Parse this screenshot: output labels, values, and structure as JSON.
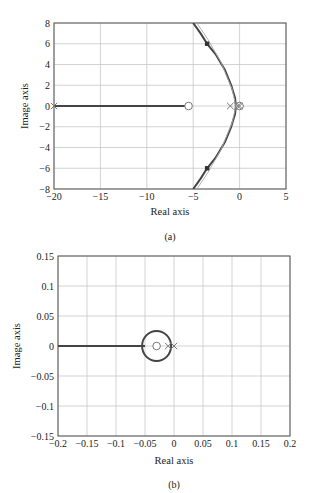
{
  "chart_data": [
    {
      "id": "a",
      "type": "line",
      "title": "",
      "caption": "(a)",
      "xlabel": "Real axis",
      "ylabel": "Image axis",
      "xlim": [
        -20,
        5
      ],
      "ylim": [
        -8,
        8
      ],
      "xticks": [
        -20,
        -15,
        -10,
        -5,
        0,
        5
      ],
      "xtick_labels": [
        "−20",
        "−15",
        "−10",
        "−5",
        "0",
        "5"
      ],
      "yticks": [
        -8,
        -6,
        -4,
        -2,
        0,
        2,
        4,
        6,
        8
      ],
      "ytick_labels": [
        "−8",
        "−6",
        "−4",
        "−2",
        "0",
        "2",
        "4",
        "6",
        "8"
      ],
      "grid": true,
      "series": [
        {
          "name": "real-axis-locus",
          "x": [
            -20,
            -5.5
          ],
          "y": [
            0,
            0
          ]
        },
        {
          "name": "upper-branch",
          "x": [
            -5.0,
            -4.2,
            -3.5,
            -2.6,
            -1.6,
            -0.9,
            -0.5,
            -0.4
          ],
          "y": [
            8,
            7,
            6,
            5,
            3.5,
            2,
            0.8,
            0
          ]
        },
        {
          "name": "lower-branch",
          "x": [
            -0.4,
            -0.5,
            -0.9,
            -1.6,
            -2.6,
            -3.5,
            -4.2,
            -5.0
          ],
          "y": [
            0,
            -0.8,
            -2,
            -3.5,
            -5,
            -6,
            -7,
            -8
          ]
        },
        {
          "name": "asymptote-thin",
          "x": [
            -4.6,
            -3.4,
            -2.0,
            -0.8,
            -0.4,
            -0.8,
            -2.0,
            -3.4,
            -4.6
          ],
          "y": [
            8,
            6.4,
            4.2,
            1.6,
            0,
            -1.6,
            -4.2,
            -6.4,
            -8
          ]
        }
      ],
      "poles": [
        [
          -20,
          0
        ],
        [
          -1,
          0
        ],
        [
          -0.2,
          0
        ],
        [
          0,
          0
        ]
      ],
      "zeros": [
        [
          -5.5,
          0
        ],
        [
          0,
          0
        ]
      ],
      "marked_points": [
        [
          -3.5,
          6
        ],
        [
          -3.5,
          -6
        ]
      ]
    },
    {
      "id": "b",
      "type": "line",
      "title": "",
      "caption": "(b)",
      "xlabel": "Real axis",
      "ylabel": "Image axis",
      "xlim": [
        -0.2,
        0.2
      ],
      "ylim": [
        -0.15,
        0.15
      ],
      "xticks": [
        -0.2,
        -0.15,
        -0.1,
        -0.05,
        0,
        0.05,
        0.1,
        0.15,
        0.2
      ],
      "xtick_labels": [
        "−0.2",
        "−0.15",
        "−0.1",
        "−0.05",
        "0",
        "0.05",
        "0.1",
        "0.15",
        "0.2"
      ],
      "yticks": [
        -0.15,
        -0.1,
        -0.05,
        0,
        0.05,
        0.1,
        0.15
      ],
      "ytick_labels": [
        "−0.15",
        "−0.1",
        "−0.05",
        "0",
        "0.05",
        "0.1",
        "0.15"
      ],
      "grid": true,
      "series": [
        {
          "name": "real-axis-locus",
          "x": [
            -0.2,
            -0.05
          ],
          "y": [
            0,
            0
          ]
        },
        {
          "name": "circle-locus",
          "center": [
            -0.03,
            0
          ],
          "radius": 0.025
        }
      ],
      "poles": [
        [
          -0.01,
          0
        ],
        [
          0,
          0
        ]
      ],
      "zeros": [
        [
          -0.03,
          0
        ]
      ]
    }
  ]
}
